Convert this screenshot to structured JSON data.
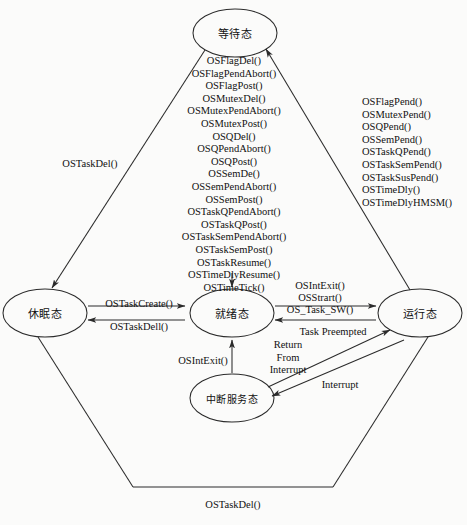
{
  "diagram": {
    "stroke_color": "#2b2b2b",
    "background_color": "#fbfbfa",
    "states": [
      {
        "id": "waiting",
        "label": "等待态",
        "cx": 235,
        "cy": 33,
        "rx": 42,
        "ry": 24
      },
      {
        "id": "dormant",
        "label": "休眠态",
        "cx": 45,
        "cy": 313,
        "rx": 42,
        "ry": 24
      },
      {
        "id": "ready",
        "label": "就绪态",
        "cx": 232,
        "cy": 313,
        "rx": 42,
        "ry": 24
      },
      {
        "id": "running",
        "label": "运行态",
        "cx": 420,
        "cy": 313,
        "rx": 42,
        "ry": 24
      },
      {
        "id": "isr",
        "label": "中断服务态",
        "cx": 232,
        "cy": 398,
        "rx": 42,
        "ry": 24
      }
    ],
    "edge_labels": [
      {
        "id": "task-del-left",
        "text": "OSTaskDel()",
        "x": 90,
        "y": 163
      },
      {
        "id": "task-create",
        "text": "OSTaskCreate()",
        "x": 139,
        "y": 303
      },
      {
        "id": "task-dell",
        "text": "OSTaskDell()",
        "x": 139,
        "y": 326
      },
      {
        "id": "int-exit-ready",
        "text": "OSIntExit()",
        "x": 203,
        "y": 360
      },
      {
        "id": "int-exit-run",
        "text": "OSIntExit()",
        "x": 320,
        "y": 285
      },
      {
        "id": "os-start",
        "text": "OSStrart()",
        "x": 320,
        "y": 297
      },
      {
        "id": "os-task-sw",
        "text": "OS_Task_SW()",
        "x": 320,
        "y": 309
      },
      {
        "id": "task-preempted",
        "text": "Task Preempted",
        "x": 333,
        "y": 331
      },
      {
        "id": "return-1",
        "text": "Return",
        "x": 288,
        "y": 344
      },
      {
        "id": "return-2",
        "text": "From",
        "x": 288,
        "y": 357
      },
      {
        "id": "return-3",
        "text": "Interrupt",
        "x": 288,
        "y": 369
      },
      {
        "id": "interrupt",
        "text": "Interrupt",
        "x": 340,
        "y": 384
      },
      {
        "id": "task-del-bottom",
        "text": "OSTaskDel()",
        "x": 233,
        "y": 504
      }
    ],
    "api_groups": [
      {
        "id": "post-and-resume-calls",
        "x": 234,
        "y": 55,
        "items": [
          "OSFlagDel()",
          "OSFlagPendAbort()",
          "OSFlagPost()",
          "OSMutexDel()",
          "OSMutexPendAbort()",
          "OSMutexPost()",
          "OSQDel()",
          "OSQPendAbort()",
          "OSQPost()",
          "OSSemDe()",
          "OSSemPendAbort()",
          "OSSemPost()",
          "OSTaskQPendAbort()",
          "OSTaskQPost()",
          "OSTaskSemPendAbort()",
          "OSTaskSemPost()",
          "OSTaskResume()",
          "OSTimeDlyResume()",
          "OSTimeTick()"
        ]
      },
      {
        "id": "pend-calls",
        "x": 362,
        "y": 96,
        "items": [
          "OSFlagPend()",
          "OSMutexPend()",
          "OSQPend()",
          "OSSemPend()",
          "OSTaskQPend()",
          "OSTaskSemPend()",
          "OSTaskSusPend()",
          "OSTimeDly()",
          "OSTimeDlyHMSM()"
        ]
      }
    ]
  }
}
